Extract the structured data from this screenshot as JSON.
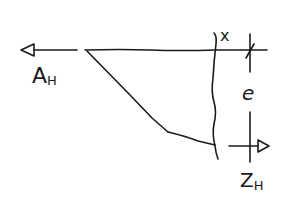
{
  "diagram": {
    "type": "free-body sketch",
    "style": "hand-drawn",
    "stroke_color": "#1a1a1a",
    "background": "#ffffff",
    "labels": {
      "left_force": {
        "main": "A",
        "sub": "H"
      },
      "right_force": {
        "main": "Z",
        "sub": "H"
      },
      "cut_label": "x",
      "dimension_label": "e"
    },
    "elements": [
      {
        "name": "left-force-arrow",
        "direction": "left",
        "label": "A_H"
      },
      {
        "name": "top-horizontal-member",
        "description": "horizontal line from pivot to right"
      },
      {
        "name": "diagonal-member",
        "description": "diagonal from top-left down to bottom"
      },
      {
        "name": "bottom-member",
        "description": "short bottom segment to cut line"
      },
      {
        "name": "cut-line",
        "description": "wavy vertical section cut",
        "label": "x"
      },
      {
        "name": "dimension-line",
        "description": "vertical distance between top and bottom",
        "label": "e"
      },
      {
        "name": "right-force-arrow",
        "direction": "right",
        "label": "Z_H"
      }
    ]
  }
}
